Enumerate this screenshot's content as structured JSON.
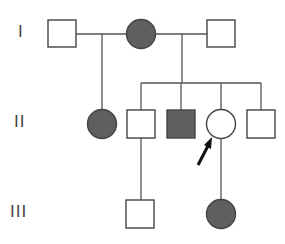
{
  "diagram": {
    "type": "pedigree",
    "generations": [
      {
        "label": "I",
        "y": 34
      },
      {
        "label": "II",
        "y": 124
      },
      {
        "label": "III",
        "y": 214
      }
    ],
    "colors": {
      "affected_fill": "#5f5f5f",
      "unaffected_fill": "#ffffff",
      "line": "#555555",
      "arrow": "#111111"
    },
    "individuals": [
      {
        "id": "I-1",
        "sex": "male",
        "affected": false
      },
      {
        "id": "I-2",
        "sex": "female",
        "affected": true
      },
      {
        "id": "I-3",
        "sex": "male",
        "affected": false
      },
      {
        "id": "II-1",
        "sex": "female",
        "affected": true
      },
      {
        "id": "II-2",
        "sex": "male",
        "affected": false
      },
      {
        "id": "II-3",
        "sex": "male",
        "affected": true
      },
      {
        "id": "II-4",
        "sex": "female",
        "affected": false,
        "proband": true
      },
      {
        "id": "II-5",
        "sex": "male",
        "affected": false
      },
      {
        "id": "III-1",
        "sex": "male",
        "affected": false
      },
      {
        "id": "III-2",
        "sex": "female",
        "affected": true
      }
    ],
    "proband_marker": "arrow"
  }
}
